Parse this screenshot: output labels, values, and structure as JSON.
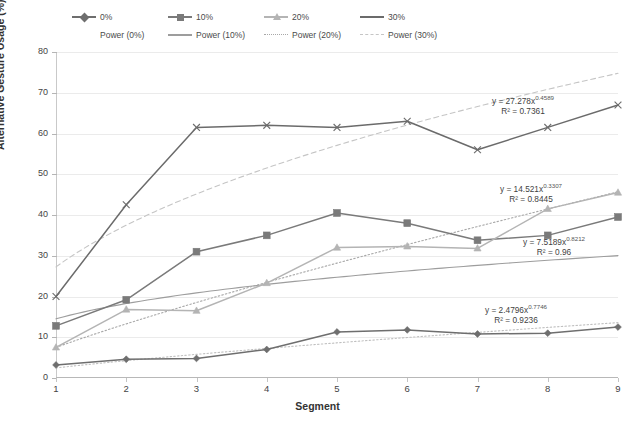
{
  "chart_data": {
    "type": "line",
    "title": "",
    "xlabel": "Segment",
    "ylabel": "Alternative Gesture Usage (%)",
    "x": [
      1,
      2,
      3,
      4,
      5,
      6,
      7,
      8,
      9
    ],
    "xlim": [
      1,
      9
    ],
    "ylim": [
      0,
      80
    ],
    "yticks": [
      0,
      10,
      20,
      30,
      40,
      50,
      60,
      70,
      80
    ],
    "xticks": [
      1,
      2,
      3,
      4,
      5,
      6,
      7,
      8,
      9
    ],
    "grid": "horizontal",
    "legend_position": "top",
    "series": [
      {
        "name": "0%",
        "marker": "diamond",
        "color": "#6e6e6e",
        "style": "solid",
        "values": [
          3.2,
          4.6,
          4.8,
          7.0,
          11.3,
          11.8,
          10.8,
          11.0,
          12.5
        ]
      },
      {
        "name": "10%",
        "marker": "square",
        "color": "#7a7a7a",
        "style": "solid",
        "values": [
          12.8,
          19.2,
          31.0,
          35.0,
          40.5,
          38.0,
          33.8,
          35.0,
          39.5
        ]
      },
      {
        "name": "20%",
        "marker": "triangle",
        "color": "#b4b4b4",
        "style": "solid",
        "values": [
          7.5,
          16.8,
          16.5,
          23.3,
          32.0,
          32.3,
          31.8,
          41.5,
          45.5
        ]
      },
      {
        "name": "30%",
        "marker": "cross",
        "color": "#6b6b6b",
        "style": "solid",
        "values": [
          20.0,
          42.5,
          61.5,
          62.0,
          61.5,
          63.0,
          56.0,
          61.5,
          67.0
        ]
      }
    ],
    "trendlines": [
      {
        "name": "Power (0%)",
        "color": "#c0c0c0",
        "style": "dotted",
        "coefficient": 2.4796,
        "exponent": 0.7746,
        "r2": 0.9236
      },
      {
        "name": "Power (10%)",
        "color": "#9d9d9d",
        "style": "solid",
        "coefficient": 14.521,
        "exponent": 0.3307,
        "r2": 0.8445
      },
      {
        "name": "Power (20%)",
        "color": "#a8a8a8",
        "style": "dotted",
        "coefficient": 7.5189,
        "exponent": 0.8212,
        "r2": 0.96
      },
      {
        "name": "Power (30%)",
        "color": "#c5c5c5",
        "style": "dashed",
        "coefficient": 27.278,
        "exponent": 0.4589,
        "r2": 0.7361
      }
    ],
    "annotations": [
      {
        "id": "eq-30",
        "line1": "y = 27.278x",
        "exponent": "0.4589",
        "line2": "R² = 0.7361"
      },
      {
        "id": "eq-10",
        "line1": "y = 14.521x",
        "exponent": "0.3307",
        "line2": "R² = 0.8445"
      },
      {
        "id": "eq-20",
        "line1": "y = 7.5189x",
        "exponent": "0.8212",
        "line2": "R² = 0.96"
      },
      {
        "id": "eq-0",
        "line1": "y = 2.4796x",
        "exponent": "0.7746",
        "line2": "R² = 0.9236"
      }
    ]
  },
  "legend": {
    "row1": [
      {
        "label": "0%",
        "marker": "diamond",
        "color": "#6e6e6e",
        "style": "solid"
      },
      {
        "label": "10%",
        "marker": "square",
        "color": "#7a7a7a",
        "style": "solid"
      },
      {
        "label": "20%",
        "marker": "triangle",
        "color": "#b4b4b4",
        "style": "solid"
      },
      {
        "label": "30%",
        "marker": "none",
        "color": "#6b6b6b",
        "style": "solid"
      }
    ],
    "row2": [
      {
        "label": "Power (0%)",
        "marker": "none",
        "color": "#ffffff",
        "style": "none"
      },
      {
        "label": "Power (10%)",
        "marker": "none",
        "color": "#9d9d9d",
        "style": "solid"
      },
      {
        "label": "Power (20%)",
        "marker": "none",
        "color": "#a8a8a8",
        "style": "dotted"
      },
      {
        "label": "Power (30%)",
        "marker": "none",
        "color": "#c5c5c5",
        "style": "dashed"
      }
    ]
  },
  "axes": {
    "y_title": "Alternative Gesture Usage (%)",
    "x_title": "Segment",
    "y_tick_labels": [
      "0",
      "10",
      "20",
      "30",
      "40",
      "50",
      "60",
      "70",
      "80"
    ],
    "x_tick_labels": [
      "1",
      "2",
      "3",
      "4",
      "5",
      "6",
      "7",
      "8",
      "9"
    ]
  },
  "colors": {
    "grid": "#ebebeb",
    "axis": "#b8b8b8",
    "text": "#3b3b3b",
    "background": "#ffffff"
  }
}
